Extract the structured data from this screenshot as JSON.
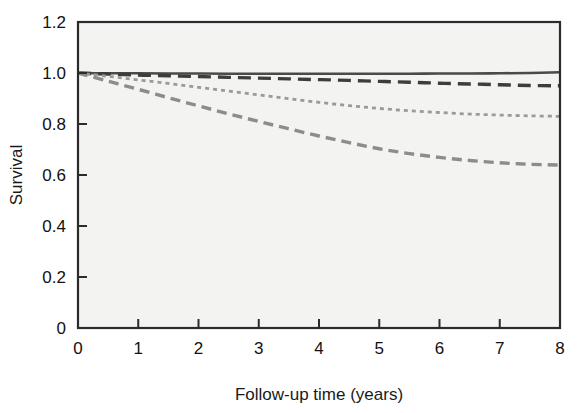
{
  "figure": {
    "background_color": "#ffffff",
    "plot_background_color": "#f3f3f1",
    "frame_color": "#2b2b2b"
  },
  "chart_data": {
    "type": "line",
    "title": "",
    "subtitle": "",
    "xlabel": "Follow-up time (years)",
    "ylabel": "Survival",
    "xlim": [
      0,
      8
    ],
    "ylim": [
      0,
      1.2
    ],
    "xticks": [
      0,
      1,
      2,
      3,
      4,
      5,
      6,
      7,
      8
    ],
    "xtick_labels": [
      "0",
      "1",
      "2",
      "3",
      "4",
      "5",
      "6",
      "7",
      "8"
    ],
    "yticks": [
      0,
      0.2,
      0.4,
      0.6,
      0.8,
      1.0,
      1.2
    ],
    "ytick_labels": [
      "0",
      "0.2",
      "0.4",
      "0.6",
      "0.8",
      "1.0",
      "1.2"
    ],
    "grid": false,
    "legend": "none",
    "x": [
      0,
      0.5,
      1,
      1.5,
      2,
      2.5,
      3,
      3.5,
      4,
      4.5,
      5,
      5.5,
      6,
      6.5,
      7,
      7.5,
      8
    ],
    "series": [
      {
        "name": "Group 1",
        "style": "solid",
        "color": "#4a4a4a",
        "dasharray": "",
        "width": 2.6,
        "values": [
          1.0,
          0.999,
          0.999,
          0.998,
          0.998,
          0.997,
          0.997,
          0.997,
          0.997,
          0.997,
          0.997,
          0.997,
          0.998,
          0.998,
          0.999,
          1.0,
          1.003
        ]
      },
      {
        "name": "Group 2",
        "style": "long-dash",
        "color": "#3d3d3d",
        "dasharray": "13,7",
        "width": 3.4,
        "values": [
          1.0,
          0.996,
          0.992,
          0.989,
          0.986,
          0.983,
          0.98,
          0.977,
          0.974,
          0.971,
          0.967,
          0.964,
          0.96,
          0.957,
          0.954,
          0.951,
          0.95
        ]
      },
      {
        "name": "Group 3",
        "style": "fine-dot",
        "color": "#9a9a9a",
        "dasharray": "4,4",
        "width": 2.8,
        "values": [
          1.0,
          0.987,
          0.973,
          0.959,
          0.944,
          0.929,
          0.914,
          0.899,
          0.885,
          0.872,
          0.861,
          0.852,
          0.845,
          0.839,
          0.835,
          0.832,
          0.83
        ]
      },
      {
        "name": "Group 4",
        "style": "medium-dash",
        "color": "#8c8c8c",
        "dasharray": "10,6",
        "width": 3.4,
        "values": [
          1.0,
          0.968,
          0.936,
          0.903,
          0.871,
          0.84,
          0.81,
          0.781,
          0.753,
          0.727,
          0.703,
          0.684,
          0.669,
          0.657,
          0.648,
          0.642,
          0.639
        ]
      }
    ]
  }
}
